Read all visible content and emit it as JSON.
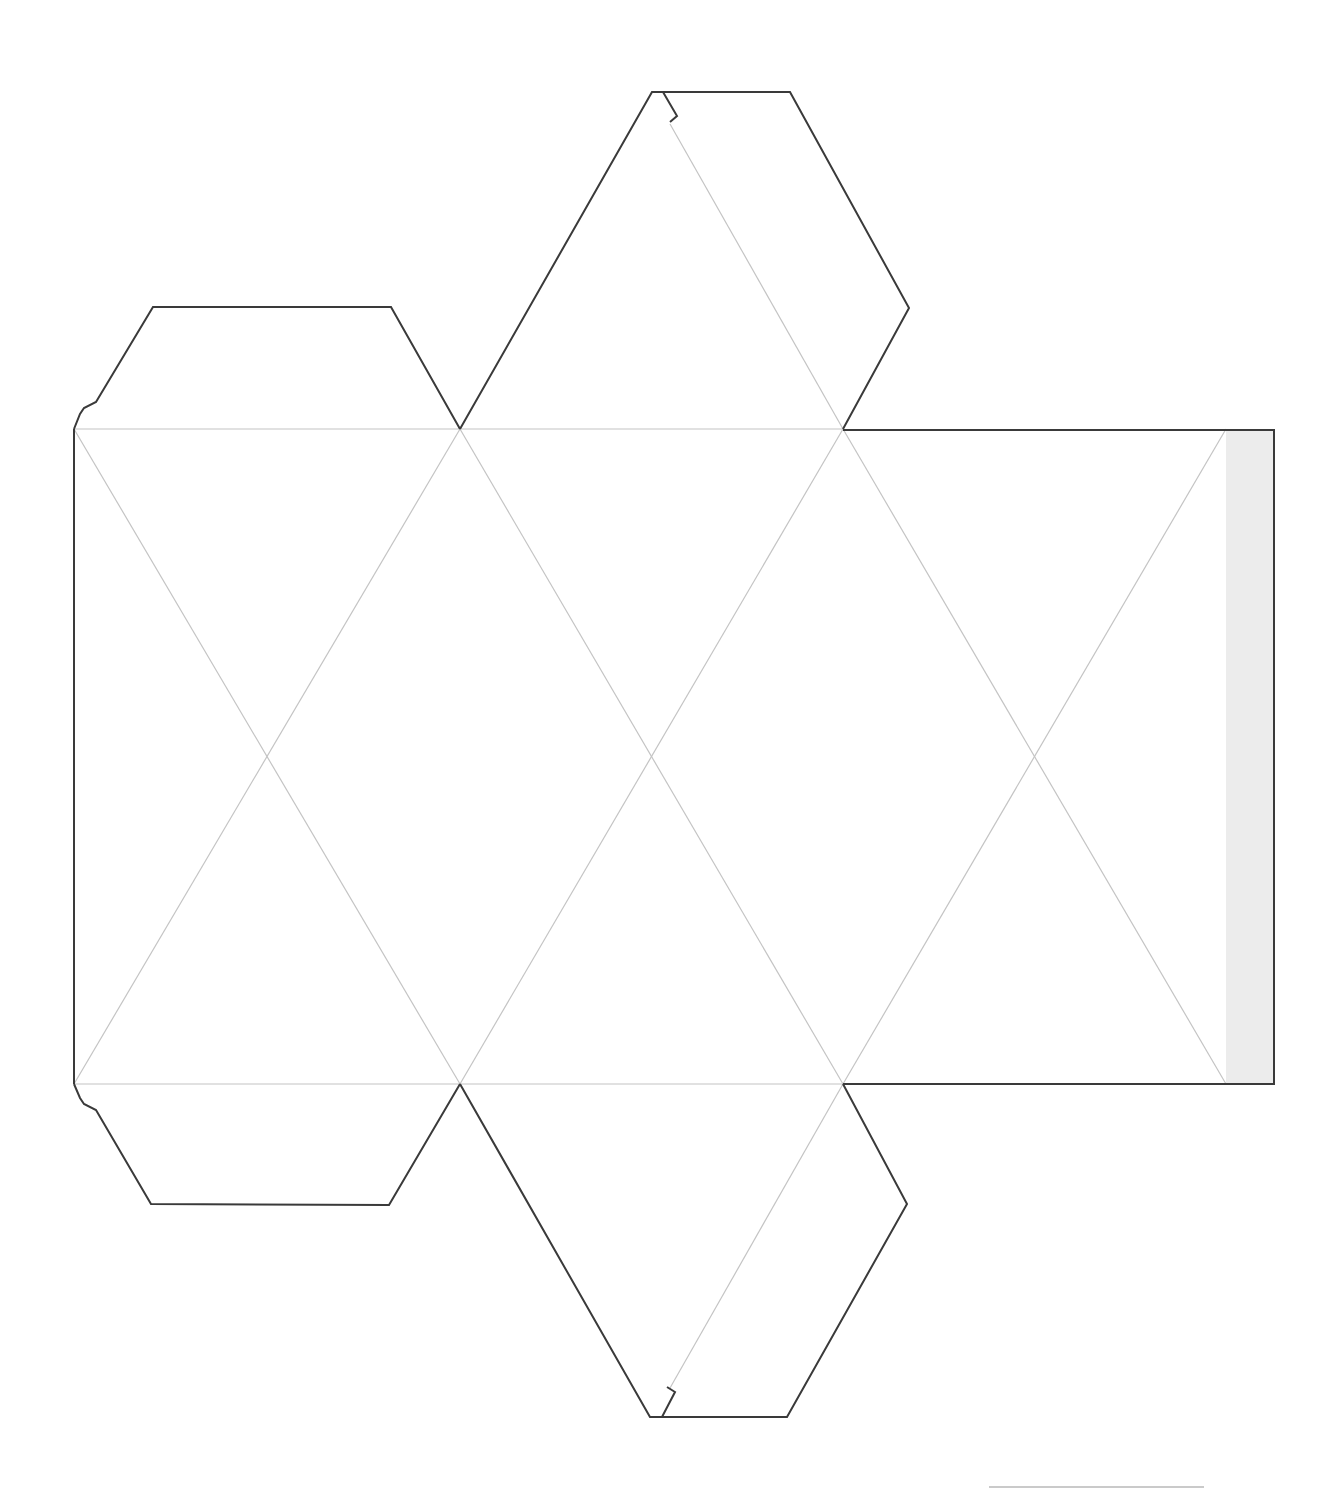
{
  "diagram": {
    "type": "paper-craft-net",
    "colors": {
      "cut_line": "#3a3a3a",
      "fold_line": "#c4c4c4",
      "glue_strip": "#ececec",
      "background": "#ffffff"
    },
    "grid": {
      "top_y": 429,
      "mid_y": 757,
      "bottom_y": 1084,
      "top_row_x": [
        74,
        460,
        843,
        1226
      ],
      "mid_row_x": [
        267,
        651,
        1034
      ],
      "bottom_row_x": [
        74,
        460,
        843,
        1226
      ]
    },
    "tabs": [
      {
        "name": "top-left-flap",
        "points": "74,429 80,414 84,408 96,402 153,307 391,307 460,429"
      },
      {
        "name": "bottom-left-flap",
        "points": "74,1084 80,1098 84,1104 96,1110 151,1204 389,1205 460,1084"
      },
      {
        "name": "top-center-flap",
        "points": "460,429 652,92 790,92 909,308 843,429"
      },
      {
        "name": "bottom-center-flap",
        "points": "460,1084 650,1417 787,1417 907,1204 843,1084"
      }
    ],
    "glue_strip": {
      "x": 1226,
      "y": 429,
      "width": 48,
      "height": 655
    },
    "signature_line": {
      "x1": 989,
      "y1": 1487,
      "x2": 1204,
      "y2": 1487
    }
  }
}
